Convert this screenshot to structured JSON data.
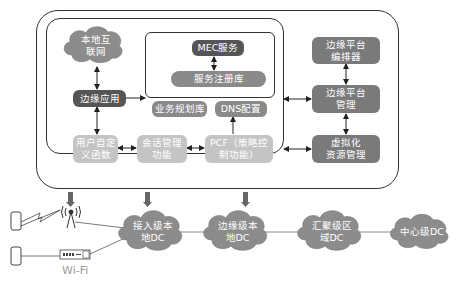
{
  "diagram": {
    "local_internet": "本地互联网",
    "local_internet_lines": [
      "本地互",
      "联网"
    ],
    "edge_app": "边缘应用",
    "mec_service": "MEC服务",
    "service_registry": "服务注册库",
    "service_planning": "业务规划库",
    "dns_config": "DNS配置",
    "udf": [
      "用户自定",
      "义函数"
    ],
    "session_mgmt": [
      "会话管理",
      "功能"
    ],
    "pcf": [
      "PCF（策略控",
      "制功能）"
    ],
    "orchestrator": [
      "边缘平台",
      "编排器"
    ],
    "platform_mgmt": [
      "边缘平台",
      "管理"
    ],
    "virt_resource": [
      "虚拟化",
      "资源管理"
    ],
    "access_dc": [
      "接入级本",
      "地DC"
    ],
    "edge_dc": [
      "边缘级本",
      "地DC"
    ],
    "aggregation_dc": [
      "汇聚级区",
      "域DC"
    ],
    "center_dc": "中心级DC",
    "wifi_label": "Wi-Fi",
    "icons": [
      "phone-icon",
      "phone-icon",
      "cell-tower-icon",
      "wifi-router-icon",
      "lightning-link-icon"
    ]
  },
  "colors": {
    "dark": "#555555",
    "mid": "#8a8a8a",
    "light": "#c4c4c4",
    "cloud": "#8c8c8c",
    "line": "#333333"
  }
}
